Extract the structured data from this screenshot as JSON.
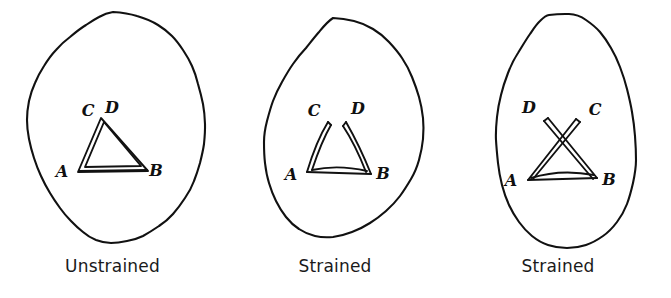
{
  "figure": {
    "background_color": "#ffffff",
    "ink_color": "#111111",
    "width": 671,
    "height": 298
  },
  "panels": [
    {
      "id": "unstrained",
      "caption": "Unstrained",
      "state": "unstrained",
      "description": "Irregular rounded outline containing two nearly coincident triangles sharing base AB, with apexes C and D almost superimposed",
      "vertex_labels": {
        "a": "A",
        "b": "B",
        "c": "C",
        "d": "D"
      },
      "geometry": {
        "outline_points": "113,12 137,16 158,25 172,36 183,50 192,66 198,84 203,104 205,124 204,144 200,163 194,181 185,198 173,214 159,226 143,236 127,241 111,243 96,240 83,232 71,221 60,208 50,193 41,176 34,158 29,139 27,120 29,101 35,83 44,66 56,50 70,37 86,25 99,17",
        "triangle_abc": {
          "a": [
            78,
            172
          ],
          "b": [
            148,
            171
          ],
          "c": [
            101,
            118
          ]
        },
        "triangle_abd": {
          "a": [
            80,
            167
          ],
          "b": [
            145,
            167
          ],
          "d": [
            104,
            119
          ]
        },
        "label_a": [
          62,
          177
        ],
        "label_b": [
          153,
          176
        ],
        "label_c": [
          86,
          116
        ],
        "label_d": [
          107,
          115
        ]
      }
    },
    {
      "id": "strained-1",
      "caption": "Strained",
      "state": "strained",
      "description": "Egg-shaped outline elongated upward; triangles ACB and ADB have separated so apexes C and D are pulled apart",
      "vertex_labels": {
        "a": "A",
        "b": "B",
        "c": "C",
        "d": "D"
      },
      "geometry": {
        "outline_points": "108,18 129,21 148,29 164,42 177,58 187,77 194,97 198,118 198,139 194,160 186,179 175,196 161,211 145,223 127,232 108,237 90,236 74,229 61,217 51,201 44,183 40,163 39,142 42,121 48,101 57,82 68,64 81,48 94,32",
        "triangle_acb": {
          "a": [
            82,
            172
          ],
          "b": [
            146,
            174
          ],
          "c": [
            103,
            122
          ]
        },
        "triangle_adb": {
          "a": [
            84,
            168
          ],
          "b": [
            143,
            170
          ],
          "d": [
            121,
            122
          ]
        },
        "label_a": [
          66,
          180
        ],
        "label_b": [
          152,
          179
        ],
        "label_c": [
          88,
          117
        ],
        "label_d": [
          129,
          116
        ]
      }
    },
    {
      "id": "strained-2",
      "caption": "Strained",
      "state": "strained",
      "description": "Strongly elongated tilted outline; the triangle limbs have rotated past one another so that D lies to the left and C to the right, and segments AC and BD cross",
      "vertex_labels": {
        "a": "A",
        "b": "B",
        "c": "C",
        "d": "D"
      },
      "geometry": {
        "outline_points": "104,15 124,14 141,20 155,32 166,48 175,67 182,89 187,112 190,136 191,160 188,183 182,204 172,222 158,236 141,245 122,248 103,245 87,236 74,222 64,205 57,185 53,163 51,140 52,117 56,95 63,73 73,53 85,34 95,21",
        "triangle_acb": {
          "a": [
            83,
            180
          ],
          "b": [
            152,
            178
          ],
          "c": [
            131,
            119
          ]
        },
        "triangle_adb": {
          "a": [
            85,
            176
          ],
          "b": [
            149,
            174
          ],
          "d": [
            103,
            118
          ]
        },
        "label_a": [
          66,
          186
        ],
        "label_b": [
          159,
          185
        ],
        "label_c": [
          146,
          116
        ],
        "label_d": [
          84,
          114
        ]
      }
    }
  ]
}
